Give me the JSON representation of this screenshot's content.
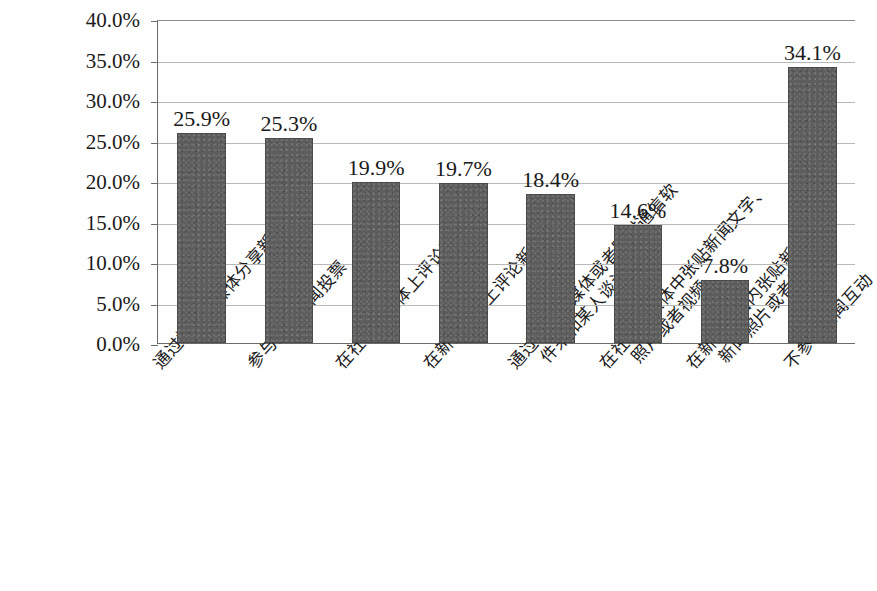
{
  "chart_data": {
    "type": "bar",
    "title": "",
    "subtitle": "",
    "xlabel": "",
    "ylabel": "",
    "ylim": [
      0,
      40
    ],
    "grid": true,
    "legend": "none",
    "y_tick_labels": [
      "0.0%",
      "5.0%",
      "10.0%",
      "15.0%",
      "20.0%",
      "25.0%",
      "30.0%",
      "35.0%",
      "40.0%"
    ],
    "y_tick_values": [
      0,
      5,
      10,
      15,
      20,
      25,
      30,
      35,
      40
    ],
    "categories": [
      "通过社会化媒体分享新闻链接",
      "参与网络新闻投票",
      "在社会化媒体上评论新闻",
      "在新闻网站上评论新闻",
      "通过社会化媒体或者即时通信软件来和某人谈论新闻",
      "在社会化媒体中张贴新闻文字、照片或者视频",
      "在新闻网站内张贴新闻文字、新闻照片或者视频",
      "不参与新闻互动"
    ],
    "category_lines": [
      [
        "通过社会化媒体分享新闻链接"
      ],
      [
        "参与网络新闻投票"
      ],
      [
        "在社会化媒体上评论新闻"
      ],
      [
        "在新闻网站上评论新闻"
      ],
      [
        "通过社会化媒体或者即时通信软",
        "件来和某人谈论新闻"
      ],
      [
        "在社会化媒体中张贴新闻文字、",
        "照片或者视频"
      ],
      [
        "在新闻网站内张贴新闻文字、",
        "新闻照片或者视频"
      ],
      [
        "不参与新闻互动"
      ]
    ],
    "values": [
      25.9,
      25.3,
      19.9,
      19.7,
      18.4,
      14.6,
      7.8,
      34.1
    ],
    "value_labels": [
      "25.9%",
      "25.3%",
      "19.9%",
      "19.7%",
      "18.4%",
      "14.6%",
      "7.8%",
      "34.1%"
    ],
    "colors": {
      "bar_fill": "#5d5d5d",
      "bar_stroke": "#4a4a4a",
      "gridline": "#b9b9b9",
      "axis": "#6b6b6b",
      "text": "#1a1a1a",
      "plot_background": "#fefefe"
    }
  }
}
